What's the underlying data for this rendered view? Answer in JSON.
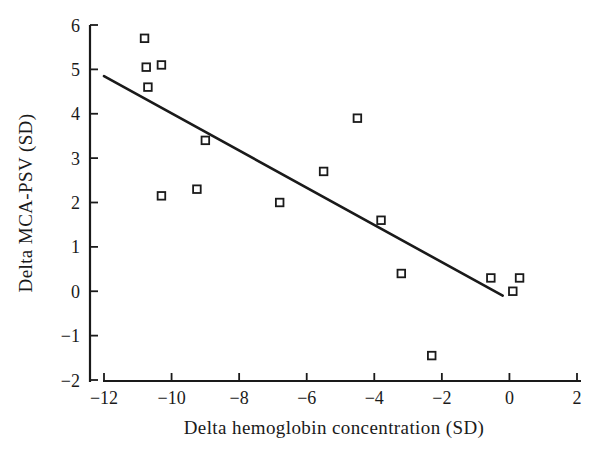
{
  "figure": {
    "width_px": 603,
    "height_px": 451
  },
  "colors": {
    "ink": "#1a1a1a",
    "background": "#ffffff"
  },
  "chart_data": {
    "type": "scatter",
    "title": "",
    "xlabel": "Delta hemoglobin concentration (SD)",
    "ylabel": "Delta MCA-PSV (SD)",
    "xlim": [
      -12,
      2
    ],
    "ylim": [
      -2,
      6
    ],
    "x_ticks": [
      -12,
      -10,
      -8,
      -6,
      -4,
      -2,
      0,
      2
    ],
    "y_ticks": [
      -2,
      -1,
      0,
      1,
      2,
      3,
      4,
      5,
      6
    ],
    "grid": false,
    "legend": "none",
    "marker": "open-square",
    "points": [
      {
        "x": -10.8,
        "y": 5.7
      },
      {
        "x": -10.75,
        "y": 5.05
      },
      {
        "x": -10.3,
        "y": 5.1
      },
      {
        "x": -10.7,
        "y": 4.6
      },
      {
        "x": -9.0,
        "y": 3.4
      },
      {
        "x": -10.3,
        "y": 2.15
      },
      {
        "x": -9.25,
        "y": 2.3
      },
      {
        "x": -6.8,
        "y": 2.0
      },
      {
        "x": -5.5,
        "y": 2.7
      },
      {
        "x": -4.5,
        "y": 3.9
      },
      {
        "x": -3.8,
        "y": 1.6
      },
      {
        "x": -3.2,
        "y": 0.4
      },
      {
        "x": -2.3,
        "y": -1.45
      },
      {
        "x": -0.55,
        "y": 0.3
      },
      {
        "x": 0.1,
        "y": 0.0
      },
      {
        "x": 0.3,
        "y": 0.3
      }
    ],
    "regression_line": {
      "x1": -12.0,
      "y1": 4.85,
      "x2": -0.2,
      "y2": -0.1
    }
  }
}
